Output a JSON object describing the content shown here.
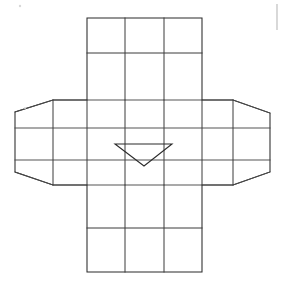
{
  "document": {
    "title": "Cross-shaped grid net diagram with center arrow",
    "kind": "line-drawing",
    "background_color": "#ffffff",
    "line_color": "#2b2b2b",
    "width": 286,
    "height": 289
  },
  "figure": {
    "name": "cross-net",
    "description": "Unfolded cross-shaped net composed of a vertical central band and two flared side wings, all subdivided into rectangular grid cells, with a downward-pointing triangular arrow marker in the central cell.",
    "stroke_color": "#2b2b2b",
    "fill_color": "none",
    "panels": [
      {
        "name": "top-panel",
        "label": "top",
        "rows": 2,
        "columns": 3,
        "bounds": {
          "x": 87,
          "y": 18,
          "width": 115,
          "height": 82
        }
      },
      {
        "name": "left-wing",
        "label": "left",
        "rows": 3,
        "columns": 2,
        "flared": true,
        "bounds": {
          "x": 15,
          "y": 100,
          "width": 72,
          "height": 85
        }
      },
      {
        "name": "center-panel",
        "label": "center",
        "rows": 3,
        "columns": 3,
        "bounds": {
          "x": 87,
          "y": 100,
          "width": 115,
          "height": 85
        }
      },
      {
        "name": "right-wing",
        "label": "right",
        "rows": 3,
        "columns": 2,
        "flared": true,
        "bounds": {
          "x": 202,
          "y": 100,
          "width": 68,
          "height": 85
        }
      },
      {
        "name": "bottom-panel",
        "label": "bottom",
        "rows": 2,
        "columns": 3,
        "bounds": {
          "x": 87,
          "y": 185,
          "width": 115,
          "height": 87
        }
      }
    ],
    "outline_points": "87,18 202,18 202,100 233,100 270,113 270,172 233,185 202,185 202,272 87,272 87,185 53,185 15,172 15,112 53,100 87,100",
    "vertical_grid_x": [
      87,
      125,
      164,
      202
    ],
    "horizontal_grid_y": [
      18,
      53,
      100,
      128,
      160,
      185,
      228,
      272
    ],
    "wing_left_inner_x": 53,
    "wing_right_inner_x": 233,
    "arrow": {
      "name": "center-arrow",
      "direction": "down",
      "points": "115,144 172,144 144,166 115,144",
      "vertices": {
        "left": {
          "x": 115,
          "y": 144
        },
        "right": {
          "x": 172,
          "y": 144
        },
        "apex": {
          "x": 144,
          "y": 166
        }
      }
    },
    "artifacts": [
      {
        "name": "right-edge-mark",
        "x": 277,
        "y1": 4,
        "y2": 30
      },
      {
        "name": "speck-top-left",
        "x": 20,
        "y": 6,
        "r": 1.2
      },
      {
        "name": "speck-mid-left",
        "x": 25,
        "y": 108,
        "r": 1.0
      }
    ]
  }
}
